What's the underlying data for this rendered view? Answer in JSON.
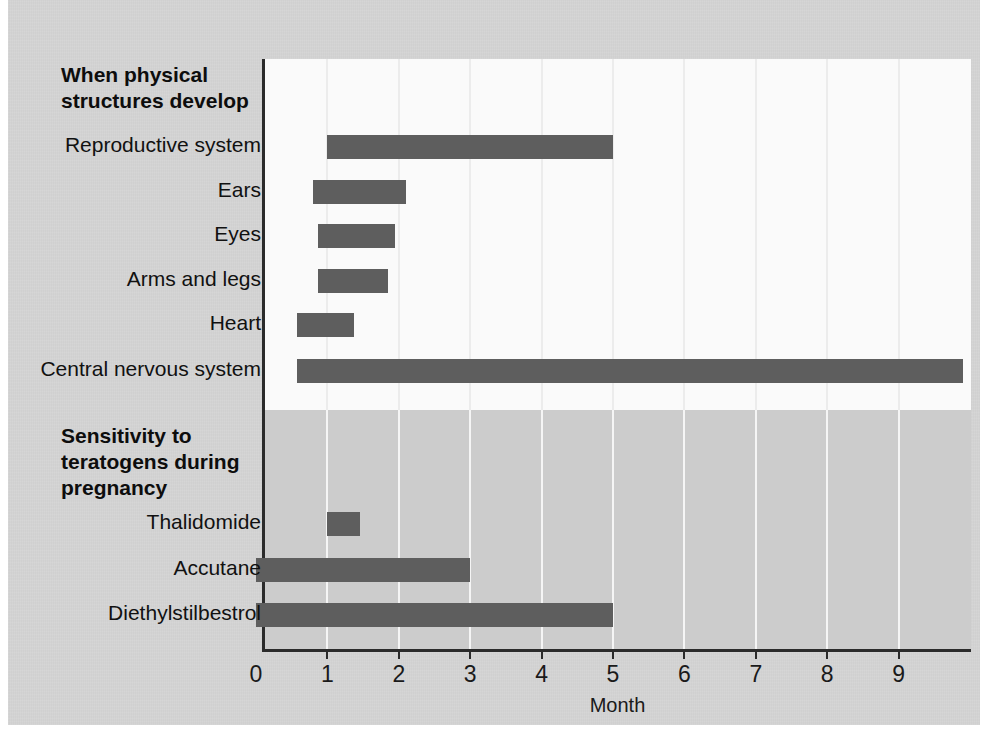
{
  "figure": {
    "background_color": "#d4d4d4",
    "top_panel_color": "#fafafa",
    "bottom_panel_color": "#cccccc",
    "bar_color": "#5e5e5e",
    "axis_color": "#2b2b2b"
  },
  "sections": [
    {
      "id": "physical-structures",
      "title": "When physical\nstructures develop"
    },
    {
      "id": "teratogen-sensitivity",
      "title": "Sensitivity to\nteratogens during\npregnancy"
    }
  ],
  "axis": {
    "title": "Month",
    "ticks": [
      0,
      1,
      2,
      3,
      4,
      5,
      6,
      7,
      8,
      9
    ],
    "tick_labels": [
      "0",
      "1",
      "2",
      "3",
      "4",
      "5",
      "6",
      "7",
      "8",
      "9"
    ]
  },
  "rows": [
    {
      "label": "Reproductive system",
      "section": "physical-structures",
      "start": 1.0,
      "end": 5.0
    },
    {
      "label": "Ears",
      "section": "physical-structures",
      "start": 0.8,
      "end": 2.1
    },
    {
      "label": "Eyes",
      "section": "physical-structures",
      "start": 0.87,
      "end": 1.95
    },
    {
      "label": "Arms and legs",
      "section": "physical-structures",
      "start": 0.87,
      "end": 1.85
    },
    {
      "label": "Heart",
      "section": "physical-structures",
      "start": 0.57,
      "end": 1.37
    },
    {
      "label": "Central nervous system",
      "section": "physical-structures",
      "start": 0.57,
      "end": 9.9
    },
    {
      "label": "Thalidomide",
      "section": "teratogen-sensitivity",
      "start": 1.0,
      "end": 1.45
    },
    {
      "label": "Accutane",
      "section": "teratogen-sensitivity",
      "start": 0.0,
      "end": 3.0
    },
    {
      "label": "Diethylstilbestrol",
      "section": "teratogen-sensitivity",
      "start": 0.0,
      "end": 5.0
    }
  ],
  "chart_data": {
    "type": "bar",
    "orientation": "horizontal",
    "title": "",
    "subtitle": "",
    "xlabel": "Month",
    "ylabel": "",
    "xlim": [
      0,
      9.9
    ],
    "xticks": [
      0,
      1,
      2,
      3,
      4,
      5,
      6,
      7,
      8,
      9
    ],
    "grid": true,
    "grid_axis": "x",
    "legend": "none",
    "group_labels": [
      "When physical structures develop",
      "Sensitivity to teratogens during pregnancy"
    ],
    "categories": [
      "Reproductive system",
      "Ears",
      "Eyes",
      "Arms and legs",
      "Heart",
      "Central nervous system",
      "Thalidomide",
      "Accutane",
      "Diethylstilbestrol"
    ],
    "series": [
      {
        "name": "Developmental / sensitivity window (months)",
        "type": "range-bar",
        "values": [
          {
            "category": "Reproductive system",
            "start": 1.0,
            "end": 5.0,
            "group": "When physical structures develop"
          },
          {
            "category": "Ears",
            "start": 0.8,
            "end": 2.1,
            "group": "When physical structures develop"
          },
          {
            "category": "Eyes",
            "start": 0.87,
            "end": 1.95,
            "group": "When physical structures develop"
          },
          {
            "category": "Arms and legs",
            "start": 0.87,
            "end": 1.85,
            "group": "When physical structures develop"
          },
          {
            "category": "Heart",
            "start": 0.57,
            "end": 1.37,
            "group": "When physical structures develop"
          },
          {
            "category": "Central nervous system",
            "start": 0.57,
            "end": 9.9,
            "group": "When physical structures develop"
          },
          {
            "category": "Thalidomide",
            "start": 1.0,
            "end": 1.45,
            "group": "Sensitivity to teratogens during pregnancy"
          },
          {
            "category": "Accutane",
            "start": 0.0,
            "end": 3.0,
            "group": "Sensitivity to teratogens during pregnancy"
          },
          {
            "category": "Diethylstilbestrol",
            "start": 0.0,
            "end": 5.0,
            "group": "Sensitivity to teratogens during pregnancy"
          }
        ]
      }
    ]
  }
}
